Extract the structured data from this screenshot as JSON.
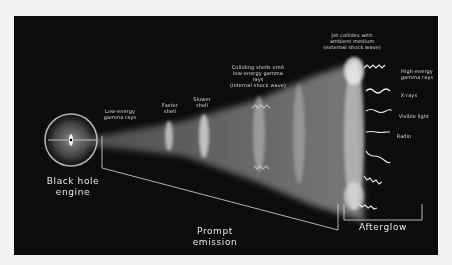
{
  "figure": {
    "background_color": "#f4f4f4",
    "panel_color": "#0c0c0c",
    "labels": {
      "engine": "Black hole engine",
      "engine_line1": "Black hole",
      "engine_line2": "engine",
      "low_energy_line1": "Low-energy",
      "low_energy_line2": "gamma rays",
      "faster_shell_line1": "Faster",
      "faster_shell_line2": "shell",
      "slower_shell_line1": "Slower",
      "slower_shell_line2": "shell",
      "colliding_line1": "Colliding shells emit",
      "colliding_line2": "low-energy gamma rays",
      "colliding_line3": "(internal shock wave)",
      "jet_line1": "Jet collides with",
      "jet_line2": "ambient medium",
      "jet_line3": "(external shock wave)",
      "high_energy_line1": "High-energy",
      "high_energy_line2": "gamma rays",
      "xrays": "X-rays",
      "visible_light": "Visible light",
      "radio": "Radio",
      "prompt_line1": "Prompt",
      "prompt_line2": "emission",
      "afterglow": "Afterglow"
    }
  }
}
